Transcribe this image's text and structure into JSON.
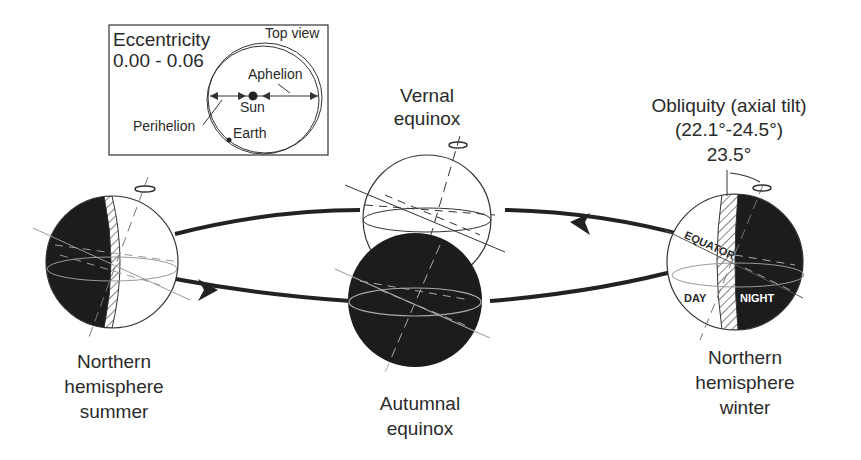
{
  "inset": {
    "title_line1": "Eccentricity",
    "title_line2": "0.00 - 0.06",
    "view_label": "Top view",
    "aphelion": "Aphelion",
    "sun": "Sun",
    "perihelion": "Perihelion",
    "earth": "Earth"
  },
  "vernal": {
    "line1": "Vernal",
    "line2": "equinox"
  },
  "obliquity": {
    "line1": "Obliquity (axial tilt)",
    "line2": "(22.1°-24.5°)",
    "line3": "23.5°"
  },
  "winter_globe": {
    "equator": "EQUATOR",
    "day": "DAY",
    "night": "NIGHT"
  },
  "labels": {
    "summer": [
      "Northern",
      "hemisphere",
      "summer"
    ],
    "autumnal": [
      "Autumnal",
      "equinox"
    ],
    "winter": [
      "Northern",
      "hemisphere",
      "winter"
    ]
  },
  "colors": {
    "ink": "#2a2a2a",
    "shade": "#1c1c1c",
    "paper": "#ffffff"
  }
}
